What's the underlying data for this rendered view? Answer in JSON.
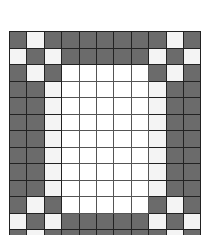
{
  "board": {
    "columns": 11,
    "rows": 13,
    "legend": {
      "D": "dark",
      "L": "light",
      "W": "white"
    },
    "colors": {
      "dark": "#6b6b6b",
      "light": "#f4f4f4",
      "white": "#ffffff",
      "gridline": "#222222"
    },
    "cells": [
      "DLDDDDDDDLD",
      "LDLDDDDDLDL",
      "DLDWWWWWDLD",
      "DDLWWWWWLDD",
      "DDLWWWWWLDD",
      "DDLWWWWWLDD",
      "DDLWWWWWLDD",
      "DDLWWWWWLDD",
      "DDLWWWWWLDD",
      "DDLWWWWWLDD",
      "DLDWWWWWDLD",
      "LDLDDDDDLDL",
      "DLDDDDDDDLD"
    ]
  }
}
